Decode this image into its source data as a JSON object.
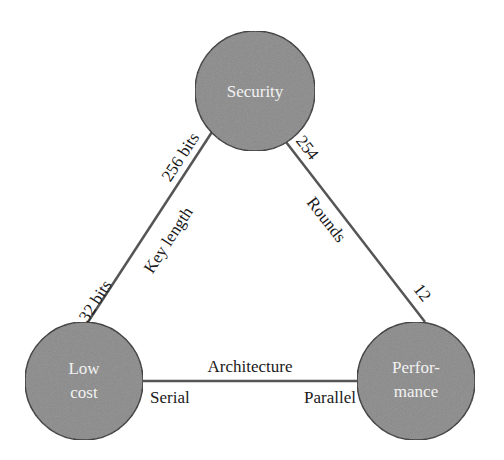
{
  "diagram": {
    "type": "tradeoff-triangle",
    "colors": {
      "node_fill": "#8a8a8a",
      "node_stroke": "#2a2a2a",
      "node_text": "#f2f2f2",
      "edge": "#555555",
      "label_text": "#1a1a1a"
    },
    "nodes": {
      "security": {
        "label": "Security"
      },
      "low_cost": {
        "line1": "Low",
        "line2": "cost"
      },
      "performance": {
        "line1": "Perfor-",
        "line2": "mance"
      }
    },
    "edges": {
      "key_length": {
        "title": "Key length",
        "low_end": "32 bits",
        "high_end": "256 bits"
      },
      "rounds": {
        "title": "Rounds",
        "high_end": "254",
        "low_end": "12"
      },
      "architecture": {
        "title": "Architecture",
        "left_end": "Serial",
        "right_end": "Parallel"
      }
    }
  }
}
